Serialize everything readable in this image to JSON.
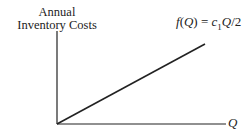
{
  "diagram": {
    "y_axis_label_line1": "Annual",
    "y_axis_label_line2": "Inventory Costs",
    "x_axis_label": "Q",
    "function_label": {
      "f": "f",
      "open": "(",
      "var": "Q",
      "close": ")",
      "eq": " = ",
      "coef": "c",
      "sub": "1",
      "var2": "Q",
      "div": "/2"
    },
    "line": {
      "type": "linear",
      "from": "origin",
      "description": "f(Q) = c1 Q / 2"
    },
    "colors": {
      "ink": "#222222",
      "background": "#ffffff"
    }
  }
}
